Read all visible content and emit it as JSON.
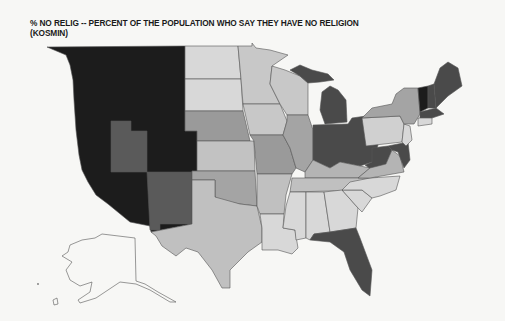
{
  "title": {
    "line1": "% NO RELIG -- PERCENT OF THE POPULATION WHO SAY THEY HAVE NO RELIGION",
    "line2": "(KOSMIN)"
  },
  "map": {
    "type": "choropleth",
    "region": "United States",
    "variable": "% NO RELIG",
    "source": "KOSMIN",
    "shading_classes": [
      {
        "class": "highest",
        "color": "#1c1c1c"
      },
      {
        "class": "high",
        "color": "#4a4a4a"
      },
      {
        "class": "medium",
        "color": "#8f8f8f"
      },
      {
        "class": "low",
        "color": "#b4b4b4"
      },
      {
        "class": "lowest",
        "color": "#d6d6d6"
      },
      {
        "class": "no data",
        "color": "#ffffff"
      }
    ],
    "states": {
      "WA": "highest",
      "OR": "highest",
      "CA": "highest",
      "NV": "highest",
      "ID": "highest",
      "MT": "highest",
      "WY": "highest",
      "CO": "highest",
      "AZ": "highest",
      "UT": "high",
      "NM": "high",
      "ND": "lowest",
      "SD": "lowest",
      "NE": "medium",
      "KS": "low",
      "OK": "medium",
      "TX": "low",
      "MN": "low",
      "IA": "low",
      "MO": "medium",
      "AR": "low",
      "LA": "lowest",
      "WI": "low",
      "IL": "medium",
      "MS": "lowest",
      "AL": "lowest",
      "TN": "low",
      "MI": "high",
      "IN": "high",
      "OH": "high",
      "KY": "low",
      "GA": "lowest",
      "FL": "high",
      "SC": "lowest",
      "NC": "lowest",
      "VA": "low",
      "WV": "high",
      "PA": "lowest",
      "NY": "medium",
      "NJ": "lowest",
      "MD": "high",
      "DE": "high",
      "VT": "highest",
      "NH": "high",
      "ME": "high",
      "MA": "high",
      "CT": "lowest",
      "RI": "lowest",
      "AK": "no data",
      "HI": "no data"
    }
  }
}
